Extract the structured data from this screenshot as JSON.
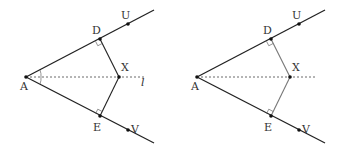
{
  "figures": [
    {
      "id": "left",
      "points": {
        "A": [
          26,
          77
        ],
        "D": [
          100,
          39
        ],
        "X": [
          119,
          77
        ],
        "E": [
          100,
          116
        ],
        "U": [
          128,
          24
        ],
        "V": [
          128,
          130
        ]
      },
      "ray_ends": {
        "upper": [
          154,
          10
        ],
        "lower": [
          154,
          143
        ]
      },
      "bisector_end": [
        145,
        77
      ],
      "bisector_label": "l",
      "labels": {
        "A": "A",
        "D": "D",
        "X": "X",
        "E": "E",
        "U": "U",
        "V": "V"
      },
      "angle_marks": true,
      "segment_color": "#222222"
    },
    {
      "id": "right",
      "points": {
        "A": [
          197,
          77
        ],
        "D": [
          271,
          39
        ],
        "X": [
          290,
          77
        ],
        "E": [
          271,
          116
        ],
        "U": [
          299,
          24
        ],
        "V": [
          299,
          130
        ]
      },
      "ray_ends": {
        "upper": [
          325,
          10
        ],
        "lower": [
          325,
          143
        ]
      },
      "bisector_end": [
        316,
        77
      ],
      "bisector_label": "",
      "labels": {
        "A": "A",
        "D": "D",
        "X": "X",
        "E": "E",
        "U": "U",
        "V": "V"
      },
      "angle_marks": false,
      "segment_color": "#777777"
    }
  ],
  "colors": {
    "line": "#222222",
    "dashed": "#444444",
    "point": "#111111"
  }
}
